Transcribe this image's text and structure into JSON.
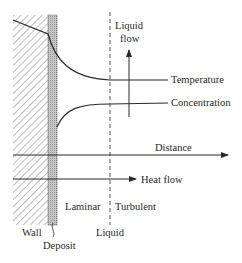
{
  "diagram": {
    "regions": {
      "wall": "Wall",
      "deposit": "Deposit",
      "laminar": "Laminar",
      "turbulent": "Turbulent",
      "liquid": "Liquid"
    },
    "curves": {
      "temperature": "Temperature",
      "concentration": "Concentration"
    },
    "arrows": {
      "distance": "Distance",
      "heat_flow": "Heat flow",
      "liquid_flow_line1": "Liquid",
      "liquid_flow_line2": "flow"
    },
    "colors": {
      "line": "#2a2a2a",
      "hatch": "#8a8a8a",
      "deposit": "#b5b5b5"
    }
  }
}
